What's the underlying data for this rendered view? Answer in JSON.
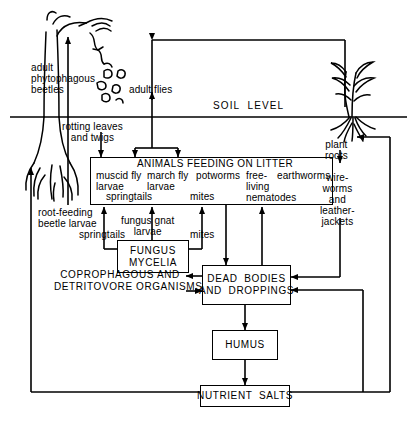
{
  "diagram": {
    "soil_level_label": "SOIL  LEVEL",
    "above_ground": {
      "adult_phytophagous_beetles": "adult\nphytophagous\nbeetles",
      "adult_flies": "adult flies"
    },
    "litter_inputs": {
      "rotting_leaves_and_twigs": "rotting leaves\nand twigs"
    },
    "litter_box": {
      "title": "ANIMALS FEEDING ON LITTER",
      "members": [
        "muscid fly\nlarvae",
        "march fly\nlarvae",
        "potworms",
        "free-\nliving\nnematodes",
        "earthworms",
        "springtails",
        "mites"
      ]
    },
    "below_litter_feeders": {
      "root_feeding_beetle_larvae": "root-feeding\nbeetle larvae",
      "springtails": "springtails",
      "fungus_gnat_larvae": "fungus gnat\nlarvae",
      "mites": "mites"
    },
    "right_column": {
      "plant_roots": "plant\nroots",
      "wireworms_and_leatherjackets": "wire-\nworms\nand\nleather-\njackets"
    },
    "boxes": {
      "fungus_mycelia": [
        "FUNGUS",
        "MYCELIA"
      ],
      "coprophagous": [
        "COPROPHAGOUS AND",
        "DETRITOVORE ORGANISMS"
      ],
      "dead_bodies": [
        "DEAD  BODIES",
        "AND  DROPPINGS"
      ],
      "humus": [
        "HUMUS"
      ],
      "nutrient_salts": [
        "NUTRIENT  SALTS"
      ]
    },
    "colors": {
      "ink": "#000000",
      "paper": "#ffffff"
    }
  }
}
